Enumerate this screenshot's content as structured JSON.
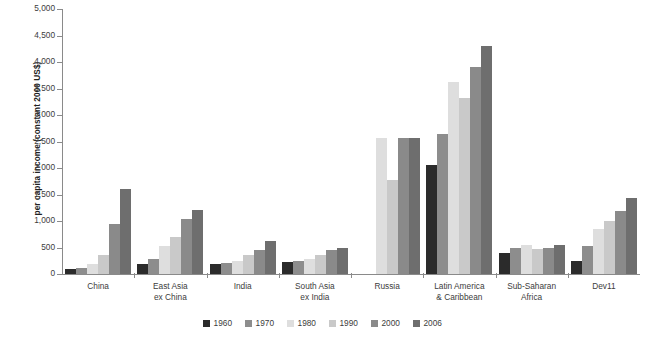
{
  "chart_data": {
    "type": "bar",
    "title": "",
    "subtitle": "",
    "xlabel": "",
    "ylabel": "per capita income (constant 2000 US$)",
    "ylim": [
      0,
      5000
    ],
    "ytick_step": 500,
    "ytick_labels": [
      "0",
      "500",
      "1,000",
      "1,500",
      "2,000",
      "2,500",
      "3,000",
      "3,500",
      "4,000",
      "4,500",
      "5,000"
    ],
    "grid": false,
    "legend_position": "bottom-center",
    "categories": [
      "China",
      "East Asia\nex China",
      "India",
      "South Asia\nex India",
      "Russia",
      "Latin America\n& Caribbean",
      "Sub-Saharan\nAfrica",
      "Dev11"
    ],
    "series": [
      {
        "name": "1960",
        "color": "#2b2b2b",
        "values": [
          100,
          180,
          180,
          230,
          null,
          2050,
          390,
          240
        ]
      },
      {
        "name": "1970",
        "color": "#8d8d8d",
        "values": [
          120,
          280,
          210,
          250,
          null,
          2650,
          500,
          520
        ]
      },
      {
        "name": "1980",
        "color": "#dedede",
        "values": [
          180,
          530,
          250,
          280,
          2570,
          3620,
          550,
          850
        ]
      },
      {
        "name": "1990",
        "color": "#c9c9c9",
        "values": [
          350,
          700,
          350,
          350,
          1780,
          3320,
          480,
          1000
        ]
      },
      {
        "name": "2000",
        "color": "#8a8a8a",
        "values": [
          950,
          1030,
          460,
          450,
          2570,
          3900,
          490,
          1180
        ]
      },
      {
        "name": "2006",
        "color": "#6e6e6e",
        "values": [
          1600,
          1200,
          620,
          500,
          2570,
          4300,
          550,
          1430
        ]
      }
    ]
  },
  "legend": {
    "items": [
      {
        "label": "1960",
        "color": "#2b2b2b"
      },
      {
        "label": "1970",
        "color": "#8d8d8d"
      },
      {
        "label": "1980",
        "color": "#dedede"
      },
      {
        "label": "1990",
        "color": "#c9c9c9"
      },
      {
        "label": "2000",
        "color": "#8a8a8a"
      },
      {
        "label": "2006",
        "color": "#6e6e6e"
      }
    ]
  }
}
